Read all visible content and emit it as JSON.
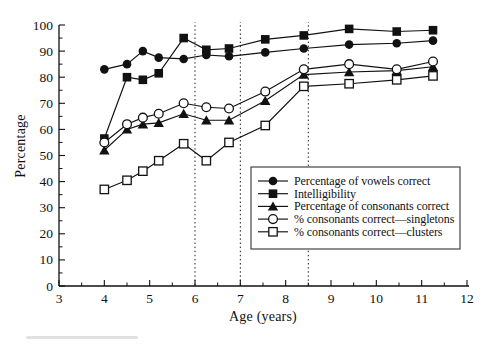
{
  "figure": {
    "background": "#ffffff",
    "ink_color": "#111111",
    "dashed_line_color": "#222222"
  },
  "chart_data": {
    "type": "line",
    "title": "",
    "xlabel": "Age (years)",
    "ylabel": "Percentage",
    "xlim": [
      3,
      12
    ],
    "ylim": [
      0,
      100
    ],
    "x_major_ticks": [
      3,
      4,
      5,
      6,
      7,
      8,
      9,
      10,
      11,
      12
    ],
    "x_minor_step": 0.5,
    "y_major_ticks": [
      0,
      10,
      20,
      30,
      40,
      50,
      60,
      70,
      80,
      90,
      100
    ],
    "y_minor_step": 5,
    "grid": false,
    "dashed_vlines_at_ages": [
      6,
      7,
      8.5
    ],
    "legend_position": "inside-middle-right",
    "x": [
      4.0,
      4.5,
      4.85,
      5.2,
      5.75,
      6.25,
      6.75,
      7.55,
      8.4,
      9.4,
      10.45,
      11.25
    ],
    "series": [
      {
        "name": "Percentage of vowels correct",
        "marker": "filled-circle",
        "values": [
          83,
          85,
          90,
          87.5,
          87,
          88.5,
          88,
          89.5,
          91,
          92.5,
          93,
          94
        ]
      },
      {
        "name": "Intelligibility",
        "marker": "filled-square",
        "values": [
          56.5,
          80,
          79,
          81.5,
          95,
          90.5,
          91,
          94.5,
          96,
          98.5,
          97.5,
          98
        ]
      },
      {
        "name": "Percentage of consonants correct",
        "marker": "filled-triangle",
        "values": [
          52,
          60,
          62,
          62.5,
          66,
          63.5,
          63.5,
          71,
          81,
          82,
          82.5,
          84
        ]
      },
      {
        "name": "% consonants correct—singletons",
        "marker": "open-circle",
        "values": [
          55,
          62,
          64.5,
          66,
          70,
          68.5,
          68,
          74.5,
          83,
          85,
          83,
          86
        ]
      },
      {
        "name": "% consonants correct—clusters",
        "marker": "open-square",
        "values": [
          37,
          40.5,
          44,
          48,
          54.5,
          48,
          55,
          61.5,
          76.5,
          77.5,
          79,
          80.5
        ]
      }
    ]
  }
}
